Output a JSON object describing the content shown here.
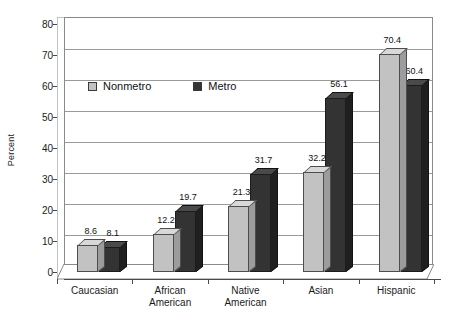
{
  "chart_data": {
    "type": "bar",
    "title": "",
    "xlabel": "",
    "ylabel": "Percent",
    "ylim": [
      0,
      80
    ],
    "ytick_step": 10,
    "yticks": [
      "0",
      "10",
      "20",
      "30",
      "40",
      "50",
      "60",
      "70",
      "80"
    ],
    "grid": "horizontal",
    "legend_position": "inside-upper-left",
    "style": "3d-clustered-column",
    "categories": [
      "Caucasian",
      "African\nAmerican",
      "Native\nAmerican",
      "Asian",
      "Hispanic"
    ],
    "category_lines": [
      [
        "Caucasian"
      ],
      [
        "African",
        "American"
      ],
      [
        "Native",
        "American"
      ],
      [
        "Asian"
      ],
      [
        "Hispanic"
      ]
    ],
    "series": [
      {
        "name": "Nonmetro",
        "color": "#c2c2c2",
        "values": [
          8.6,
          12.2,
          21.3,
          32.2,
          70.4
        ],
        "labels": [
          "8.6",
          "12.2",
          "21.3",
          "32.2",
          "70.4"
        ]
      },
      {
        "name": "Metro",
        "color": "#333333",
        "values": [
          8.1,
          19.7,
          31.7,
          56.1,
          60.4
        ],
        "labels": [
          "8.1",
          "19.7",
          "31.7",
          "56.1",
          "60.4"
        ]
      }
    ]
  },
  "colors": {
    "background": "#ffffff",
    "axis": "#4a4a4a",
    "gridline": "#9a9a9a",
    "frame": "#8a8a8a",
    "nonmetro": "#c2c2c2",
    "metro": "#333333",
    "text": "#111111"
  }
}
